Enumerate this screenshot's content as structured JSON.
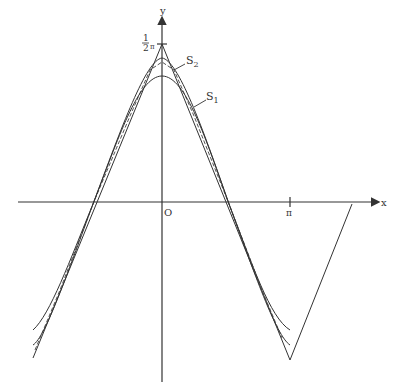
{
  "diagram": {
    "axes": {
      "x_label": "x",
      "y_label": "y",
      "origin_label": "O",
      "pi_label": "π",
      "peak_label_num": "1",
      "peak_label_den": "2",
      "peak_label_sym": "π"
    },
    "curves": [
      {
        "name": "S1",
        "label_main": "S",
        "label_sub": "1",
        "style": "solid"
      },
      {
        "name": "S2",
        "label_main": "S",
        "label_sub": "2",
        "style": "solid"
      },
      {
        "name": "triangle-wave",
        "style": "solid"
      },
      {
        "name": "dashed-approx",
        "style": "dashed"
      }
    ],
    "colors": {
      "ink": "#333333",
      "background": "#ffffff"
    }
  }
}
